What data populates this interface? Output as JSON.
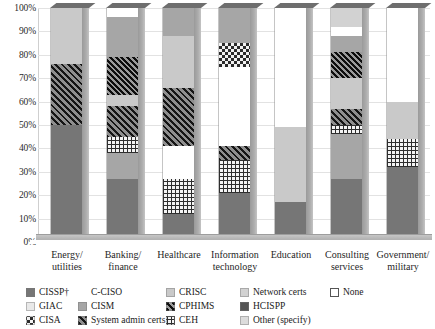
{
  "chart_data": {
    "type": "bar",
    "subtype": "stacked-percent-bar-3d",
    "title": "",
    "xlabel": "",
    "ylabel": "",
    "ylim": [
      0,
      100
    ],
    "grid": true,
    "legend_position": "bottom",
    "ytick_labels": [
      "100%",
      "90%",
      "80%",
      "70%",
      "60%",
      "50%",
      "40%",
      "30%",
      "20%",
      "10%",
      "0%"
    ],
    "ytick_values": [
      100,
      90,
      80,
      70,
      60,
      50,
      40,
      30,
      20,
      10,
      0
    ],
    "categories": [
      "Energy/\nutilities",
      "Banking/\nfinance",
      "Healthcare",
      "Information\ntechnology",
      "Education",
      "Consulting\nservices",
      "Government/\nmilitary"
    ],
    "category_lines": [
      [
        "Energy/",
        "utilities"
      ],
      [
        "Banking/",
        "finance"
      ],
      [
        "Healthcare",
        ""
      ],
      [
        "Information",
        "technology"
      ],
      [
        "Education",
        ""
      ],
      [
        "Consulting",
        "services"
      ],
      [
        "Government/",
        "military"
      ]
    ],
    "series": [
      {
        "name": "CISSP†",
        "key": "cissp",
        "values": [
          50,
          27,
          12,
          21,
          17,
          27,
          32
        ]
      },
      {
        "name": "GIAC",
        "key": "giac",
        "values": [
          0,
          0,
          0,
          0,
          0,
          0,
          0
        ]
      },
      {
        "name": "CISA",
        "key": "cisa",
        "values": [
          0,
          0,
          0,
          10,
          0,
          0,
          0
        ]
      },
      {
        "name": "C-CISO",
        "key": "cciso",
        "values": [
          0,
          4,
          14,
          34,
          51,
          4,
          40
        ]
      },
      {
        "name": "CISM",
        "key": "cism",
        "values": [
          0,
          28,
          12,
          15,
          0,
          26,
          0
        ]
      },
      {
        "name": "System admin certs",
        "key": "sysadmin",
        "values": [
          26,
          13,
          25,
          6,
          0,
          7,
          0
        ]
      },
      {
        "name": "CRISC",
        "key": "crisc",
        "values": [
          24,
          5,
          22,
          0,
          32,
          13,
          16
        ]
      },
      {
        "name": "CPHIMS",
        "key": "cphims",
        "values": [
          0,
          16,
          0,
          0,
          0,
          11,
          0
        ]
      },
      {
        "name": "CEH",
        "key": "ceh",
        "values": [
          0,
          7,
          15,
          14,
          0,
          4,
          12
        ]
      },
      {
        "name": "Network certs",
        "key": "network",
        "values": [
          0,
          0,
          0,
          0,
          0,
          8,
          0
        ]
      },
      {
        "name": "HCISPP",
        "key": "hcispp",
        "values": [
          0,
          0,
          0,
          0,
          0,
          0,
          0
        ]
      },
      {
        "name": "Other (specify)",
        "key": "other",
        "values": [
          0,
          0,
          0,
          0,
          0,
          0,
          0
        ]
      },
      {
        "name": "None",
        "key": "none",
        "values": [
          0,
          0,
          0,
          0,
          0,
          0,
          0
        ]
      }
    ],
    "stacks": [
      {
        "category": "Energy/utilities",
        "segments": [
          {
            "key": "cissp",
            "label": "CISSP†",
            "from": 0,
            "to": 50
          },
          {
            "key": "sysadmin",
            "label": "System admin certs",
            "from": 50,
            "to": 76
          },
          {
            "key": "crisc",
            "label": "CRISC",
            "from": 76,
            "to": 100
          }
        ]
      },
      {
        "category": "Banking/finance",
        "segments": [
          {
            "key": "cissp",
            "label": "CISSP†",
            "from": 0,
            "to": 27
          },
          {
            "key": "cism",
            "label": "CISM",
            "from": 27,
            "to": 38
          },
          {
            "key": "ceh",
            "label": "CEH",
            "from": 38,
            "to": 45
          },
          {
            "key": "sysadmin",
            "label": "System admin certs",
            "from": 45,
            "to": 58
          },
          {
            "key": "crisc",
            "label": "CRISC",
            "from": 58,
            "to": 63
          },
          {
            "key": "cphims",
            "label": "CPHIMS",
            "from": 63,
            "to": 79
          },
          {
            "key": "cism",
            "label": "CISM",
            "from": 79,
            "to": 96
          },
          {
            "key": "cciso",
            "label": "C-CISO",
            "from": 96,
            "to": 100
          }
        ]
      },
      {
        "category": "Healthcare",
        "segments": [
          {
            "key": "cissp",
            "label": "CISSP†",
            "from": 0,
            "to": 12
          },
          {
            "key": "ceh",
            "label": "CEH",
            "from": 12,
            "to": 27
          },
          {
            "key": "cciso",
            "label": "C-CISO",
            "from": 27,
            "to": 41
          },
          {
            "key": "sysadmin",
            "label": "System admin certs",
            "from": 41,
            "to": 66
          },
          {
            "key": "crisc",
            "label": "CRISC",
            "from": 66,
            "to": 88
          },
          {
            "key": "cism",
            "label": "CISM",
            "from": 88,
            "to": 100
          }
        ]
      },
      {
        "category": "Information technology",
        "segments": [
          {
            "key": "cissp",
            "label": "CISSP†",
            "from": 0,
            "to": 21
          },
          {
            "key": "ceh",
            "label": "CEH",
            "from": 21,
            "to": 35
          },
          {
            "key": "sysadmin",
            "label": "System admin certs",
            "from": 35,
            "to": 41
          },
          {
            "key": "cciso",
            "label": "C-CISO",
            "from": 41,
            "to": 75
          },
          {
            "key": "cisa",
            "label": "CISA",
            "from": 75,
            "to": 85
          },
          {
            "key": "cism",
            "label": "CISM",
            "from": 85,
            "to": 100
          }
        ]
      },
      {
        "category": "Education",
        "segments": [
          {
            "key": "cissp",
            "label": "CISSP†",
            "from": 0,
            "to": 17
          },
          {
            "key": "crisc",
            "label": "CRISC",
            "from": 17,
            "to": 49
          },
          {
            "key": "cciso",
            "label": "C-CISO",
            "from": 49,
            "to": 100
          }
        ]
      },
      {
        "category": "Consulting services",
        "segments": [
          {
            "key": "cissp",
            "label": "CISSP†",
            "from": 0,
            "to": 27
          },
          {
            "key": "cism",
            "label": "CISM",
            "from": 27,
            "to": 46
          },
          {
            "key": "ceh",
            "label": "CEH",
            "from": 46,
            "to": 50
          },
          {
            "key": "sysadmin",
            "label": "System admin certs",
            "from": 50,
            "to": 57
          },
          {
            "key": "crisc",
            "label": "CRISC",
            "from": 57,
            "to": 70
          },
          {
            "key": "cphims",
            "label": "CPHIMS",
            "from": 70,
            "to": 81
          },
          {
            "key": "cism",
            "label": "CISM",
            "from": 81,
            "to": 88
          },
          {
            "key": "cciso",
            "label": "C-CISO",
            "from": 88,
            "to": 92
          },
          {
            "key": "network",
            "label": "Network certs",
            "from": 92,
            "to": 100
          }
        ]
      },
      {
        "category": "Government/military",
        "segments": [
          {
            "key": "cissp",
            "label": "CISSP†",
            "from": 0,
            "to": 32
          },
          {
            "key": "ceh",
            "label": "CEH",
            "from": 32,
            "to": 44
          },
          {
            "key": "crisc",
            "label": "CRISC",
            "from": 44,
            "to": 60
          },
          {
            "key": "cciso",
            "label": "C-CISO",
            "from": 60,
            "to": 100
          }
        ]
      }
    ],
    "legend": [
      {
        "label": "CISSP†",
        "key": "cissp",
        "col": 0,
        "row": 0
      },
      {
        "label": "GIAC",
        "key": "giac",
        "col": 0,
        "row": 1
      },
      {
        "label": "CISA",
        "key": "cisa",
        "col": 0,
        "row": 2
      },
      {
        "label": "C-CISO",
        "key": "cciso",
        "col": 1,
        "row": 0
      },
      {
        "label": "CISM",
        "key": "cism",
        "col": 1,
        "row": 1
      },
      {
        "label": "System admin certs",
        "key": "sysadmin",
        "col": 1,
        "row": 2
      },
      {
        "label": "CRISC",
        "key": "crisc",
        "col": 2,
        "row": 0
      },
      {
        "label": "CPHIMS",
        "key": "cphims",
        "col": 2,
        "row": 1
      },
      {
        "label": "CEH",
        "key": "ceh",
        "col": 2,
        "row": 2
      },
      {
        "label": "Network certs",
        "key": "network",
        "col": 3,
        "row": 0
      },
      {
        "label": "HCISPP",
        "key": "hcispp",
        "col": 3,
        "row": 1
      },
      {
        "label": "Other (specify)",
        "key": "other",
        "col": 3,
        "row": 2
      },
      {
        "label": "None",
        "key": "none",
        "col": 4,
        "row": 0
      }
    ],
    "colors": {
      "cissp": "#767676",
      "giac": "#e9e9e9",
      "cisa": "#2c2c2c",
      "cciso": "#ffffff",
      "cism": "#a6a6a6",
      "sysadmin": "#5c5c5c",
      "crisc": "#c9c9c9",
      "cphims": "#4a4a4a",
      "ceh": "#2e2e2e",
      "network": "#d2d2d2",
      "hcispp": "#555555",
      "other": "#dcdcdc",
      "none": "#ffffff",
      "gridline": "#e2e2e2",
      "background": "#ffffff"
    }
  }
}
